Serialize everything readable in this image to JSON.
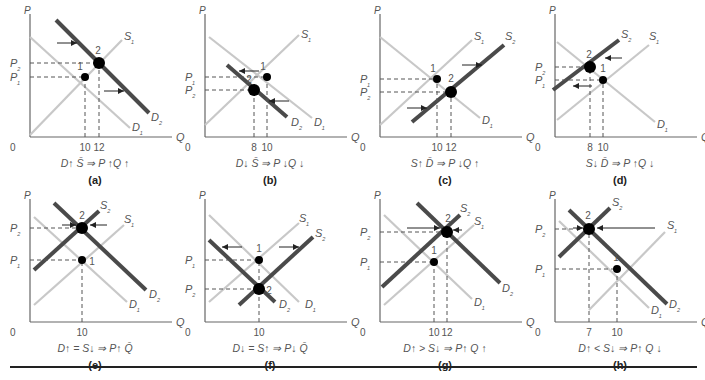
{
  "figure": {
    "colors": {
      "light_line": "#c8c8c8",
      "dark_line": "#4a4a4a",
      "axis": "#666666",
      "text": "#555555",
      "dot": "#000000"
    },
    "panels": [
      {
        "id": "a",
        "label": "(a)",
        "caption": "D↑ S̄ ⇒ P ↑Q ↑",
        "x": 10,
        "y": 10,
        "q_ticks": [
          "10",
          "12"
        ],
        "p_labels": [
          "P₂",
          "P₁"
        ],
        "curves": [
          {
            "name": "S₁",
            "style": "light",
            "x1": 18,
            "y1": 125,
            "x2": 110,
            "y2": 30,
            "lx": 112,
            "ly": 30
          },
          {
            "name": "D₁",
            "style": "light",
            "x1": 18,
            "y1": 27,
            "x2": 118,
            "y2": 118,
            "lx": 120,
            "ly": 121
          },
          {
            "name": "D₂",
            "style": "dark",
            "x1": 44,
            "y1": 10,
            "x2": 137,
            "y2": 103,
            "lx": 139,
            "ly": 111
          }
        ],
        "points": [
          {
            "n": "1",
            "x": 73,
            "y": 67,
            "r": 4,
            "lx": 68,
            "ly": 60
          },
          {
            "n": "2",
            "x": 87,
            "y": 53,
            "r": 6,
            "lx": 86,
            "ly": 44
          }
        ],
        "hdash": [
          {
            "y": 53,
            "x2": 87,
            "lab": "P₂"
          },
          {
            "y": 67,
            "x2": 73,
            "lab": "P₁"
          }
        ],
        "vdash": [
          {
            "x": 73,
            "lab": "10"
          },
          {
            "x": 87,
            "lab": "12"
          }
        ],
        "arrows": [
          {
            "x1": 45,
            "y1": 33,
            "x2": 65,
            "y2": 33
          },
          {
            "x1": 92,
            "y1": 81,
            "x2": 112,
            "y2": 81
          }
        ]
      },
      {
        "id": "b",
        "label": "(b)",
        "caption": "D↓ S̄ ⇒ P ↓Q ↓",
        "x": 185,
        "y": 10,
        "q_ticks": [
          "8",
          "10"
        ],
        "p_labels": [
          "P₁",
          "P₂"
        ],
        "curves": [
          {
            "name": "S₁",
            "style": "light",
            "x1": 18,
            "y1": 115,
            "x2": 112,
            "y2": 25,
            "lx": 114,
            "ly": 28
          },
          {
            "name": "D₁",
            "style": "light",
            "x1": 22,
            "y1": 27,
            "x2": 125,
            "y2": 108,
            "lx": 127,
            "ly": 116
          },
          {
            "name": "D₂",
            "style": "dark",
            "x1": 40,
            "y1": 55,
            "x2": 100,
            "y2": 107,
            "lx": 104,
            "ly": 116
          }
        ],
        "points": [
          {
            "n": "1",
            "x": 80,
            "y": 67,
            "r": 4,
            "lx": 76,
            "ly": 60
          },
          {
            "n": "2",
            "x": 67,
            "y": 80,
            "r": 6,
            "lx": 62,
            "ly": 73
          }
        ],
        "hdash": [
          {
            "y": 67,
            "x2": 80,
            "lab": "P₁"
          },
          {
            "y": 80,
            "x2": 67,
            "lab": "P₂"
          }
        ],
        "vdash": [
          {
            "x": 67,
            "lab": "8"
          },
          {
            "x": 80,
            "lab": "10"
          }
        ],
        "arrows": [
          {
            "x1": 72,
            "y1": 61,
            "x2": 52,
            "y2": 61
          },
          {
            "x1": 102,
            "y1": 91,
            "x2": 82,
            "y2": 91
          }
        ]
      },
      {
        "id": "c",
        "label": "(c)",
        "caption": "S↑ D̄ ⇒ P ↓Q ↑",
        "x": 360,
        "y": 10,
        "q_ticks": [
          "10",
          "12"
        ],
        "p_labels": [
          "P₁",
          "P₂"
        ],
        "curves": [
          {
            "name": "S₁",
            "style": "light",
            "x1": 18,
            "y1": 115,
            "x2": 110,
            "y2": 30,
            "lx": 112,
            "ly": 30
          },
          {
            "name": "D₁",
            "style": "light",
            "x1": 18,
            "y1": 27,
            "x2": 118,
            "y2": 108,
            "lx": 120,
            "ly": 114
          },
          {
            "name": "S₂",
            "style": "dark",
            "x1": 50,
            "y1": 112,
            "x2": 142,
            "y2": 35,
            "lx": 143,
            "ly": 30
          }
        ],
        "points": [
          {
            "n": "1",
            "x": 75,
            "y": 69,
            "r": 4,
            "lx": 71,
            "ly": 62
          },
          {
            "n": "2",
            "x": 89,
            "y": 82,
            "r": 6,
            "lx": 89,
            "ly": 72
          }
        ],
        "hdash": [
          {
            "y": 69,
            "x2": 75,
            "lab": "P₁"
          },
          {
            "y": 82,
            "x2": 89,
            "lab": "P₂"
          }
        ],
        "vdash": [
          {
            "x": 75,
            "lab": "10"
          },
          {
            "x": 89,
            "lab": "12"
          }
        ],
        "arrows": [
          {
            "x1": 100,
            "y1": 55,
            "x2": 120,
            "y2": 55
          },
          {
            "x1": 45,
            "y1": 98,
            "x2": 65,
            "y2": 98
          }
        ]
      },
      {
        "id": "d",
        "label": "(d)",
        "caption": "S↓ D̄ ⇒ P ↑Q ↓",
        "x": 535,
        "y": 10,
        "q_ticks": [
          "8",
          "10"
        ],
        "p_labels": [
          "P₂",
          "P₁"
        ],
        "curves": [
          {
            "name": "S₁",
            "style": "light",
            "x1": 20,
            "y1": 110,
            "x2": 112,
            "y2": 35,
            "lx": 112,
            "ly": 30
          },
          {
            "name": "D₁",
            "style": "light",
            "x1": 20,
            "y1": 32,
            "x2": 118,
            "y2": 112,
            "lx": 120,
            "ly": 118
          },
          {
            "name": "S₂",
            "style": "dark",
            "x1": 16,
            "y1": 80,
            "x2": 82,
            "y2": 30,
            "lx": 84,
            "ly": 28
          }
        ],
        "points": [
          {
            "n": "1",
            "x": 66,
            "y": 70,
            "r": 4,
            "lx": 66,
            "ly": 62
          },
          {
            "n": "2",
            "x": 53,
            "y": 57,
            "r": 6,
            "lx": 52,
            "ly": 48
          }
        ],
        "hdash": [
          {
            "y": 57,
            "x2": 53,
            "lab": "P₂"
          },
          {
            "y": 70,
            "x2": 66,
            "lab": "P₁"
          }
        ],
        "vdash": [
          {
            "x": 53,
            "lab": "8"
          },
          {
            "x": 66,
            "lab": "10"
          }
        ],
        "arrows": [
          {
            "x1": 85,
            "y1": 48,
            "x2": 68,
            "y2": 48
          },
          {
            "x1": 55,
            "y1": 76,
            "x2": 36,
            "y2": 76
          }
        ]
      },
      {
        "id": "e",
        "label": "(e)",
        "caption": "D↑ = S↓ ⇒ P↑ Q̄",
        "x": 10,
        "y": 195,
        "q_ticks": [
          "10"
        ],
        "p_labels": [
          "P₂",
          "P₁"
        ],
        "curves": [
          {
            "name": "S₁",
            "style": "light",
            "x1": 22,
            "y1": 110,
            "x2": 112,
            "y2": 30,
            "lx": 112,
            "ly": 28
          },
          {
            "name": "D₁",
            "style": "light",
            "x1": 22,
            "y1": 22,
            "x2": 115,
            "y2": 107,
            "lx": 117,
            "ly": 113
          },
          {
            "name": "S₂",
            "style": "dark",
            "x1": 22,
            "y1": 75,
            "x2": 87,
            "y2": 16,
            "lx": 88,
            "ly": 14
          },
          {
            "name": "D₂",
            "style": "dark",
            "x1": 42,
            "y1": 8,
            "x2": 134,
            "y2": 95,
            "lx": 137,
            "ly": 103
          }
        ],
        "points": [
          {
            "n": "1",
            "x": 70,
            "y": 65,
            "r": 4,
            "lx": 80,
            "ly": 70
          },
          {
            "n": "2",
            "x": 70,
            "y": 33,
            "r": 6,
            "lx": 70,
            "ly": 24
          }
        ],
        "hdash": [
          {
            "y": 33,
            "x2": 70,
            "lab": "P₂"
          },
          {
            "y": 65,
            "x2": 70,
            "lab": "P₁"
          }
        ],
        "vdash": [
          {
            "x": 70,
            "lab": "10"
          }
        ],
        "arrows": [
          {
            "x1": 50,
            "y1": 30,
            "x2": 64,
            "y2": 30
          },
          {
            "x1": 95,
            "y1": 30,
            "x2": 78,
            "y2": 30
          }
        ]
      },
      {
        "id": "f",
        "label": "(f)",
        "caption": "D↓ = S↑ ⇒ P↓ Q̄",
        "x": 185,
        "y": 195,
        "q_ticks": [
          "10"
        ],
        "p_labels": [
          "P₁",
          "P₂"
        ],
        "curves": [
          {
            "name": "S₁",
            "style": "light",
            "x1": 22,
            "y1": 107,
            "x2": 112,
            "y2": 28,
            "lx": 112,
            "ly": 27
          },
          {
            "name": "D₁",
            "style": "light",
            "x1": 22,
            "y1": 20,
            "x2": 112,
            "y2": 107,
            "lx": 118,
            "ly": 113
          },
          {
            "name": "D₂",
            "style": "dark",
            "x1": 22,
            "y1": 45,
            "x2": 88,
            "y2": 107,
            "lx": 92,
            "ly": 113
          },
          {
            "name": "S₂",
            "style": "dark",
            "x1": 52,
            "y1": 110,
            "x2": 126,
            "y2": 42,
            "lx": 128,
            "ly": 42
          }
        ],
        "points": [
          {
            "n": "1",
            "x": 72,
            "y": 65,
            "r": 4,
            "lx": 72,
            "ly": 57
          },
          {
            "n": "2",
            "x": 72,
            "y": 94,
            "r": 6,
            "lx": 82,
            "ly": 99
          }
        ],
        "hdash": [
          {
            "y": 65,
            "x2": 72,
            "lab": "P₁"
          },
          {
            "y": 94,
            "x2": 72,
            "lab": "P₂"
          }
        ],
        "vdash": [
          {
            "x": 72,
            "lab": "10"
          }
        ],
        "arrows": [
          {
            "x1": 55,
            "y1": 52,
            "x2": 35,
            "y2": 52
          },
          {
            "x1": 92,
            "y1": 52,
            "x2": 112,
            "y2": 52
          }
        ]
      },
      {
        "id": "g",
        "label": "(g)",
        "caption": "D↑ > S↓ ⇒ P↑ Q ↑",
        "x": 360,
        "y": 195,
        "q_ticks": [
          "10",
          "12"
        ],
        "p_labels": [
          "P₂",
          "P₁"
        ],
        "curves": [
          {
            "name": "S₁",
            "style": "light",
            "x1": 22,
            "y1": 110,
            "x2": 112,
            "y2": 30,
            "lx": 112,
            "ly": 30
          },
          {
            "name": "D₁",
            "style": "light",
            "x1": 22,
            "y1": 20,
            "x2": 110,
            "y2": 104,
            "lx": 112,
            "ly": 111
          },
          {
            "name": "S₂",
            "style": "dark",
            "x1": 20,
            "y1": 92,
            "x2": 98,
            "y2": 20,
            "lx": 98,
            "ly": 17
          },
          {
            "name": "D₂",
            "style": "dark",
            "x1": 55,
            "y1": 8,
            "x2": 138,
            "y2": 88,
            "lx": 140,
            "ly": 97
          }
        ],
        "points": [
          {
            "n": "1",
            "x": 72,
            "y": 67,
            "r": 4,
            "lx": 72,
            "ly": 59
          },
          {
            "n": "2",
            "x": 85,
            "y": 37,
            "r": 6,
            "lx": 86,
            "ly": 27
          }
        ],
        "hdash": [
          {
            "y": 37,
            "x2": 85,
            "lab": "P₂"
          },
          {
            "y": 67,
            "x2": 72,
            "lab": "P₁"
          }
        ],
        "vdash": [
          {
            "x": 72,
            "lab": "10"
          },
          {
            "x": 85,
            "lab": "12"
          }
        ],
        "arrows": [
          {
            "x1": 45,
            "y1": 33,
            "x2": 78,
            "y2": 33
          },
          {
            "x1": 100,
            "y1": 35,
            "x2": 91,
            "y2": 35
          }
        ]
      },
      {
        "id": "h",
        "label": "(h)",
        "caption": "D↑ < S↓ ⇒ P↑ Q ↓",
        "x": 535,
        "y": 195,
        "q_ticks": [
          "7",
          "10"
        ],
        "p_labels": [
          "P₂",
          "P₁"
        ],
        "curves": [
          {
            "name": "S₁",
            "style": "light",
            "x1": 52,
            "y1": 115,
            "x2": 128,
            "y2": 37,
            "lx": 130,
            "ly": 34
          },
          {
            "name": "D₁",
            "style": "light",
            "x1": 22,
            "y1": 26,
            "x2": 112,
            "y2": 113,
            "lx": 114,
            "ly": 119
          },
          {
            "name": "S₂",
            "style": "dark",
            "x1": 22,
            "y1": 62,
            "x2": 73,
            "y2": 13,
            "lx": 75,
            "ly": 11
          },
          {
            "name": "D₂",
            "style": "dark",
            "x1": 32,
            "y1": 15,
            "x2": 130,
            "y2": 109,
            "lx": 132,
            "ly": 113
          }
        ],
        "points": [
          {
            "n": "1",
            "x": 80,
            "y": 74,
            "r": 4,
            "lx": 79,
            "ly": 66
          },
          {
            "n": "2",
            "x": 52,
            "y": 34,
            "r": 6,
            "lx": 51,
            "ly": 24
          }
        ],
        "hdash": [
          {
            "y": 34,
            "x2": 52,
            "lab": "P₂"
          },
          {
            "y": 74,
            "x2": 80,
            "lab": "P₁"
          }
        ],
        "vdash": [
          {
            "x": 52,
            "lab": "7"
          },
          {
            "x": 80,
            "lab": "10"
          }
        ],
        "arrows": [
          {
            "x1": 36,
            "y1": 33,
            "x2": 46,
            "y2": 33
          },
          {
            "x1": 118,
            "y1": 33,
            "x2": 60,
            "y2": 33
          }
        ]
      }
    ],
    "axis_labels": {
      "p": "P",
      "q": "Q",
      "origin": "0"
    }
  }
}
